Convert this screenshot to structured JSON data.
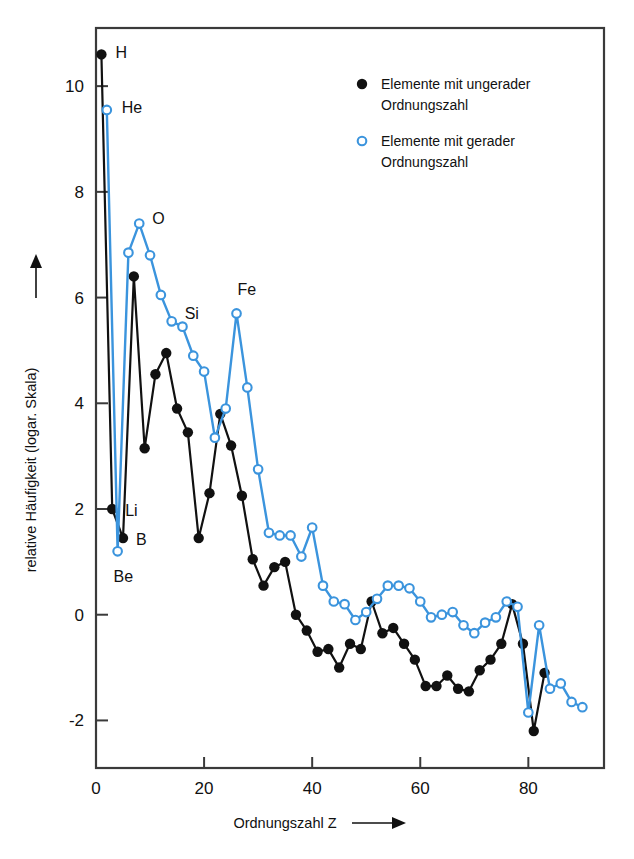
{
  "chart_data": {
    "type": "line",
    "title": "",
    "xlabel": "Ordnungszahl Z",
    "ylabel": "relative Häufigkeit (logar. Skala)",
    "xlim": [
      0,
      94
    ],
    "ylim": [
      -2.9,
      11.1
    ],
    "xticks": [
      0,
      20,
      40,
      60,
      80
    ],
    "yticks": [
      10,
      8,
      6,
      4,
      2,
      0,
      -2
    ],
    "grid": false,
    "legend_position": "top-right",
    "series": [
      {
        "name": "Elemente mit ungerader Ordnungszahl",
        "marker": "filled-circle",
        "color": "#111111",
        "points": [
          [
            1,
            10.6
          ],
          [
            3,
            2.0
          ],
          [
            5,
            1.45
          ],
          [
            7,
            6.4
          ],
          [
            9,
            3.15
          ],
          [
            11,
            4.55
          ],
          [
            13,
            4.95
          ],
          [
            15,
            3.9
          ],
          [
            17,
            3.45
          ],
          [
            19,
            1.45
          ],
          [
            21,
            2.3
          ],
          [
            23,
            3.8
          ],
          [
            25,
            3.2
          ],
          [
            27,
            2.25
          ],
          [
            29,
            1.05
          ],
          [
            31,
            0.55
          ],
          [
            33,
            0.9
          ],
          [
            35,
            1.0
          ],
          [
            37,
            0.0
          ],
          [
            39,
            -0.3
          ],
          [
            41,
            -0.7
          ],
          [
            43,
            -0.65
          ],
          [
            45,
            -1.0
          ],
          [
            47,
            -0.55
          ],
          [
            49,
            -0.65
          ],
          [
            51,
            0.25
          ],
          [
            53,
            -0.35
          ],
          [
            55,
            -0.25
          ],
          [
            57,
            -0.55
          ],
          [
            59,
            -0.85
          ],
          [
            61,
            -1.35
          ],
          [
            63,
            -1.35
          ],
          [
            65,
            -1.15
          ],
          [
            67,
            -1.4
          ],
          [
            69,
            -1.45
          ],
          [
            71,
            -1.05
          ],
          [
            73,
            -0.85
          ],
          [
            75,
            -0.55
          ],
          [
            77,
            0.2
          ],
          [
            79,
            -0.55
          ],
          [
            81,
            -2.2
          ],
          [
            83,
            -1.1
          ]
        ]
      },
      {
        "name": "Elemente mit gerader Ordnungszahl",
        "marker": "open-circle",
        "color": "#3b94dd",
        "points": [
          [
            2,
            9.55
          ],
          [
            4,
            1.2
          ],
          [
            6,
            6.85
          ],
          [
            8,
            7.4
          ],
          [
            10,
            6.8
          ],
          [
            12,
            6.05
          ],
          [
            14,
            5.55
          ],
          [
            16,
            5.45
          ],
          [
            18,
            4.9
          ],
          [
            20,
            4.6
          ],
          [
            22,
            3.35
          ],
          [
            24,
            3.9
          ],
          [
            26,
            5.7
          ],
          [
            28,
            4.3
          ],
          [
            30,
            2.75
          ],
          [
            32,
            1.55
          ],
          [
            34,
            1.5
          ],
          [
            36,
            1.5
          ],
          [
            38,
            1.1
          ],
          [
            40,
            1.65
          ],
          [
            42,
            0.55
          ],
          [
            44,
            0.25
          ],
          [
            46,
            0.2
          ],
          [
            48,
            -0.1
          ],
          [
            50,
            0.05
          ],
          [
            52,
            0.3
          ],
          [
            54,
            0.55
          ],
          [
            56,
            0.55
          ],
          [
            58,
            0.5
          ],
          [
            60,
            0.25
          ],
          [
            62,
            -0.05
          ],
          [
            64,
            0.0
          ],
          [
            66,
            0.05
          ],
          [
            68,
            -0.2
          ],
          [
            70,
            -0.35
          ],
          [
            72,
            -0.15
          ],
          [
            74,
            -0.05
          ],
          [
            76,
            0.25
          ],
          [
            78,
            0.15
          ],
          [
            80,
            -1.85
          ],
          [
            82,
            -0.2
          ],
          [
            84,
            -1.4
          ],
          [
            86,
            -1.3
          ],
          [
            88,
            -1.65
          ],
          [
            90,
            -1.75
          ]
        ]
      }
    ],
    "annotations": [
      {
        "text": "H",
        "z": 1,
        "value": 10.6,
        "dx": 14,
        "dy": -2
      },
      {
        "text": "He",
        "z": 2,
        "value": 9.55,
        "dx": 15,
        "dy": -3
      },
      {
        "text": "O",
        "z": 8,
        "value": 7.4,
        "dx": 13,
        "dy": -6
      },
      {
        "text": "Si",
        "z": 14,
        "value": 5.55,
        "dx": 13,
        "dy": -8
      },
      {
        "text": "Fe",
        "z": 26,
        "value": 5.7,
        "dx": 1,
        "dy": -24
      },
      {
        "text": "Li",
        "z": 3,
        "value": 2.0,
        "dx": 13,
        "dy": 1
      },
      {
        "text": "B",
        "z": 5,
        "value": 1.45,
        "dx": 13,
        "dy": 1
      },
      {
        "text": "Be",
        "z": 4,
        "value": 1.2,
        "dx": -4,
        "dy": 25
      }
    ]
  },
  "legend": {
    "items": [
      {
        "label_line1": "Elemente mit ungerader",
        "label_line2": "Ordnungszahl",
        "marker": "filled-circle"
      },
      {
        "label_line1": "Elemente mit gerader",
        "label_line2": "Ordnungszahl",
        "marker": "open-circle"
      }
    ]
  },
  "axes": {
    "x_title": "Ordnungszahl Z",
    "y_title": "relative Häufigkeit (logar. Skala)",
    "x_tick_labels": [
      "0",
      "20",
      "40",
      "60",
      "80"
    ],
    "y_tick_labels": [
      "10",
      "8",
      "6",
      "4",
      "2",
      "0",
      "-2"
    ]
  },
  "colors": {
    "even_series": "#3b94dd",
    "odd_series": "#111111",
    "frame": "#3a3a3a",
    "background": "#ffffff"
  }
}
